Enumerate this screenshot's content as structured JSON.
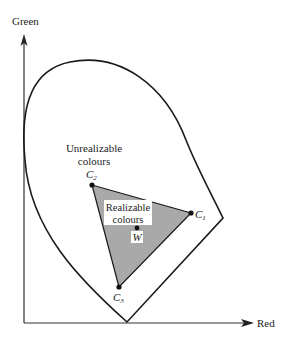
{
  "diagram": {
    "axes": {
      "y_label": "Green",
      "x_label": "Red"
    },
    "regions": {
      "outer_label_line1": "Unrealizable",
      "outer_label_line2": "colours",
      "inner_label_line1": "Realizable",
      "inner_label_line2": "colours"
    },
    "points": [
      {
        "name": "C",
        "sub": "1"
      },
      {
        "name": "C",
        "sub": "2"
      },
      {
        "name": "C",
        "sub": "3"
      },
      {
        "name": "W"
      }
    ],
    "colors": {
      "line": "#1a1a1a",
      "triangle_fill": "#a9a9a9",
      "background": "#ffffff"
    }
  }
}
